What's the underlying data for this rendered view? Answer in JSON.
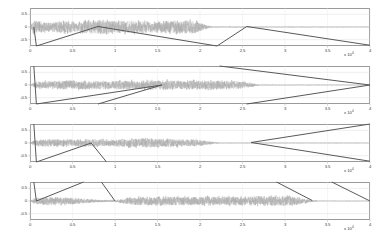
{
  "figure": {
    "title": "",
    "background": "#ffffff",
    "axis_color": "#9a9a9a",
    "waveform_color": "#9b9b9b",
    "path_color": "#595959",
    "subplot_count": 4
  },
  "axis": {
    "y_ticks": [
      "0.5",
      "0",
      "-0.5"
    ],
    "y_values": [
      0.5,
      0,
      -0.5
    ],
    "ylim": [
      -0.75,
      0.75
    ],
    "x_ticks": [
      "0",
      "0.5",
      "1",
      "1.5",
      "2",
      "2.5",
      "3",
      "3.5",
      "4"
    ],
    "x_values": [
      0,
      0.5,
      1,
      1.5,
      2,
      2.5,
      3,
      3.5,
      4
    ],
    "xlim": [
      0,
      4
    ],
    "exponent_label": "x 10",
    "exponent_power": "4",
    "xlabel": "",
    "ylabel": ""
  },
  "chart_data": {
    "type": "line",
    "title": "",
    "xlabel": "",
    "ylabel": "",
    "xlim": [
      0,
      40000
    ],
    "ylim": [
      -0.75,
      0.75
    ],
    "x_tick_labels": [
      "0",
      "0.5",
      "1",
      "1.5",
      "2",
      "2.5",
      "3",
      "3.5",
      "4"
    ],
    "x_tick_values": [
      0,
      5000,
      10000,
      15000,
      20000,
      25000,
      30000,
      35000,
      40000
    ],
    "y_tick_labels": [
      "0.5",
      "0",
      "-0.5"
    ],
    "y_tick_values": [
      0.5,
      0,
      -0.5
    ],
    "x_axis_exponent": "x 10^4",
    "grid": true,
    "legend": null,
    "subplots": [
      {
        "index": 1,
        "name": "signal-1",
        "series": [
          {
            "name": "waveform-1",
            "type": "noise-envelope",
            "color": "#9b9b9b",
            "signal_start": 0.05,
            "signal_end": 2.05,
            "envelope_points": [
              {
                "x": 0.0,
                "amp": 0.02
              },
              {
                "x": 0.05,
                "amp": 0.34
              },
              {
                "x": 0.12,
                "amp": 0.3
              },
              {
                "x": 0.25,
                "amp": 0.22
              },
              {
                "x": 0.4,
                "amp": 0.3
              },
              {
                "x": 0.55,
                "amp": 0.26
              },
              {
                "x": 0.75,
                "amp": 0.33
              },
              {
                "x": 1.0,
                "amp": 0.3
              },
              {
                "x": 1.25,
                "amp": 0.31
              },
              {
                "x": 1.5,
                "amp": 0.28
              },
              {
                "x": 1.75,
                "amp": 0.33
              },
              {
                "x": 1.95,
                "amp": 0.3
              },
              {
                "x": 2.05,
                "amp": 0.12
              },
              {
                "x": 2.15,
                "amp": 0.02
              },
              {
                "x": 4.0,
                "amp": 0.012
              }
            ]
          },
          {
            "name": "warp-path-1",
            "type": "polyline",
            "color": "#595959",
            "points": [
              {
                "x": 0.045,
                "y": 0.0
              },
              {
                "x": 0.075,
                "y": -0.75
              },
              {
                "x": 0.8,
                "y": 0.02
              },
              {
                "x": 2.2,
                "y": -0.75
              },
              {
                "x": 2.55,
                "y": 0.02
              },
              {
                "x": 4.0,
                "y": -0.72
              }
            ]
          }
        ]
      },
      {
        "index": 2,
        "name": "signal-2",
        "series": [
          {
            "name": "waveform-2",
            "type": "noise-envelope",
            "color": "#9b9b9b",
            "signal_start": 0.07,
            "signal_end": 2.6,
            "envelope_points": [
              {
                "x": 0.0,
                "amp": 0.015
              },
              {
                "x": 0.07,
                "amp": 0.16
              },
              {
                "x": 0.2,
                "amp": 0.2
              },
              {
                "x": 0.4,
                "amp": 0.22
              },
              {
                "x": 0.7,
                "amp": 0.21
              },
              {
                "x": 1.0,
                "amp": 0.22
              },
              {
                "x": 1.3,
                "amp": 0.21
              },
              {
                "x": 1.55,
                "amp": 0.24
              },
              {
                "x": 1.8,
                "amp": 0.23
              },
              {
                "x": 2.1,
                "amp": 0.22
              },
              {
                "x": 2.4,
                "amp": 0.21
              },
              {
                "x": 2.6,
                "amp": 0.1
              },
              {
                "x": 2.7,
                "amp": 0.015
              },
              {
                "x": 4.0,
                "amp": 0.01
              }
            ]
          },
          {
            "name": "warp-path-2",
            "type": "polyline",
            "color": "#595959",
            "points": [
              {
                "x": 0.045,
                "y": 0.75
              },
              {
                "x": 0.075,
                "y": -0.75
              },
              {
                "x": 1.55,
                "y": 0.0
              },
              {
                "x": 0.8,
                "y": -0.75
              }
            ]
          },
          {
            "name": "warp-path-2b",
            "type": "polyline",
            "color": "#595959",
            "points": [
              {
                "x": 2.23,
                "y": 0.75
              },
              {
                "x": 4.0,
                "y": 0.0
              },
              {
                "x": 2.55,
                "y": -0.75
              }
            ]
          }
        ]
      },
      {
        "index": 3,
        "name": "signal-3",
        "series": [
          {
            "name": "waveform-3",
            "type": "noise-envelope",
            "color": "#9b9b9b",
            "signal_start": 0.06,
            "signal_end": 2.12,
            "envelope_points": [
              {
                "x": 0.0,
                "amp": 0.015
              },
              {
                "x": 0.06,
                "amp": 0.17
              },
              {
                "x": 0.25,
                "amp": 0.18
              },
              {
                "x": 0.5,
                "amp": 0.16
              },
              {
                "x": 0.75,
                "amp": 0.19
              },
              {
                "x": 1.0,
                "amp": 0.18
              },
              {
                "x": 1.3,
                "amp": 0.22
              },
              {
                "x": 1.5,
                "amp": 0.21
              },
              {
                "x": 1.75,
                "amp": 0.19
              },
              {
                "x": 2.0,
                "amp": 0.16
              },
              {
                "x": 2.12,
                "amp": 0.07
              },
              {
                "x": 2.25,
                "amp": 0.012
              },
              {
                "x": 4.0,
                "amp": 0.01
              }
            ]
          },
          {
            "name": "warp-path-3",
            "type": "polyline",
            "color": "#595959",
            "points": [
              {
                "x": 0.045,
                "y": 0.75
              },
              {
                "x": 0.075,
                "y": -0.75
              },
              {
                "x": 0.72,
                "y": 0.0
              },
              {
                "x": 0.9,
                "y": -0.75
              }
            ]
          },
          {
            "name": "warp-path-3b",
            "type": "polyline",
            "color": "#595959",
            "points": [
              {
                "x": 4.0,
                "y": 0.75
              },
              {
                "x": 2.6,
                "y": 0.02
              },
              {
                "x": 4.0,
                "y": -0.72
              }
            ]
          }
        ]
      },
      {
        "index": 4,
        "name": "signal-4",
        "series": [
          {
            "name": "waveform-4",
            "type": "noise-envelope",
            "color": "#9b9b9b",
            "signal_start": 0.05,
            "signal_end": 3.3,
            "envelope_points": [
              {
                "x": 0.0,
                "amp": 0.012
              },
              {
                "x": 0.05,
                "amp": 0.14
              },
              {
                "x": 0.2,
                "amp": 0.2
              },
              {
                "x": 0.4,
                "amp": 0.19
              },
              {
                "x": 0.6,
                "amp": 0.13
              },
              {
                "x": 0.8,
                "amp": 0.06
              },
              {
                "x": 1.0,
                "amp": 0.05
              },
              {
                "x": 1.2,
                "amp": 0.2
              },
              {
                "x": 1.5,
                "amp": 0.22
              },
              {
                "x": 1.8,
                "amp": 0.21
              },
              {
                "x": 2.1,
                "amp": 0.22
              },
              {
                "x": 2.4,
                "amp": 0.21
              },
              {
                "x": 2.7,
                "amp": 0.24
              },
              {
                "x": 2.95,
                "amp": 0.26
              },
              {
                "x": 3.15,
                "amp": 0.2
              },
              {
                "x": 3.3,
                "amp": 0.06
              },
              {
                "x": 3.4,
                "amp": 0.01
              },
              {
                "x": 4.0,
                "amp": 0.01
              }
            ]
          },
          {
            "name": "warp-path-4",
            "type": "polyline",
            "color": "#595959",
            "points": [
              {
                "x": 0.045,
                "y": 0.75
              },
              {
                "x": 0.075,
                "y": 0.0
              },
              {
                "x": 0.63,
                "y": 0.75
              }
            ]
          },
          {
            "name": "warp-path-4b",
            "type": "polyline",
            "color": "#595959",
            "points": [
              {
                "x": 1.0,
                "y": 0.0
              },
              {
                "x": 0.84,
                "y": 0.75
              }
            ]
          },
          {
            "name": "warp-path-4c",
            "type": "polyline",
            "color": "#595959",
            "points": [
              {
                "x": 2.9,
                "y": 0.75
              },
              {
                "x": 3.32,
                "y": 0.02
              }
            ]
          },
          {
            "name": "warp-path-4d",
            "type": "polyline",
            "color": "#595959",
            "points": [
              {
                "x": 3.55,
                "y": 0.75
              },
              {
                "x": 4.0,
                "y": 0.0
              }
            ]
          }
        ]
      }
    ]
  }
}
